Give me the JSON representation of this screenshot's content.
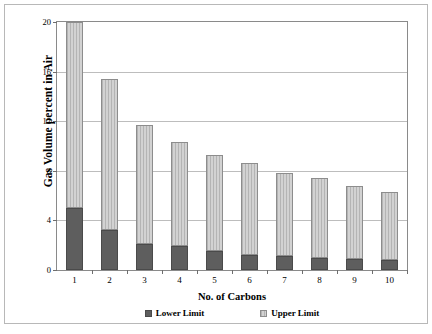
{
  "chart_data": {
    "type": "bar",
    "stacked": true,
    "title": "",
    "xlabel": "No. of Carbons",
    "ylabel": "Gas Volume percent in Air",
    "categories": [
      "1",
      "2",
      "3",
      "4",
      "5",
      "6",
      "7",
      "8",
      "9",
      "10"
    ],
    "ylim": [
      0,
      20
    ],
    "yticks": [
      0,
      4,
      8,
      12,
      16,
      20
    ],
    "ytick_labels": [
      "0",
      "4",
      "8",
      "12",
      "16",
      "20"
    ],
    "grid": true,
    "legend_position": "bottom",
    "series": [
      {
        "name": "Lower Limit",
        "color": "#5e5e5e",
        "values": [
          5.0,
          3.2,
          2.1,
          1.9,
          1.5,
          1.2,
          1.1,
          1.0,
          0.9,
          0.8
        ]
      },
      {
        "name": "Upper Limit",
        "color": "#c3c3c3",
        "values": [
          15.0,
          12.2,
          9.6,
          8.4,
          7.8,
          7.4,
          6.75,
          6.4,
          5.9,
          5.5
        ]
      }
    ],
    "totals": [
      20.0,
      15.4,
      11.7,
      10.3,
      9.3,
      8.6,
      7.85,
      7.4,
      6.8,
      6.3
    ]
  }
}
